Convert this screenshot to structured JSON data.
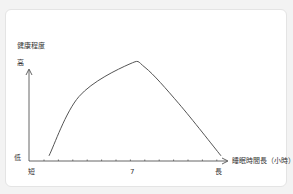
{
  "chart_data": {
    "type": "line",
    "title": "",
    "ylabel": "健康程度",
    "xlabel": "睡眠時間長（小時）",
    "y_high_label": "高",
    "y_low_label": "低",
    "x_short_label": "短",
    "x_long_label": "長",
    "x_mark_label": "7",
    "x_tick_count": 13,
    "x_mark_index": 6,
    "grid": false,
    "series": [
      {
        "name": "健康程度",
        "shape": "inverted-U",
        "points": [
          {
            "x": 0.1,
            "y": 0.05
          },
          {
            "x": 0.25,
            "y": 0.62
          },
          {
            "x": 0.5,
            "y": 0.93
          },
          {
            "x": 0.58,
            "y": 0.9
          },
          {
            "x": 0.75,
            "y": 0.55
          },
          {
            "x": 0.96,
            "y": 0.05
          }
        ]
      }
    ],
    "xlim": [
      0,
      1
    ],
    "ylim": [
      0,
      1
    ],
    "colors": {
      "line": "#555555",
      "axis": "#555555",
      "text": "#333333"
    }
  }
}
